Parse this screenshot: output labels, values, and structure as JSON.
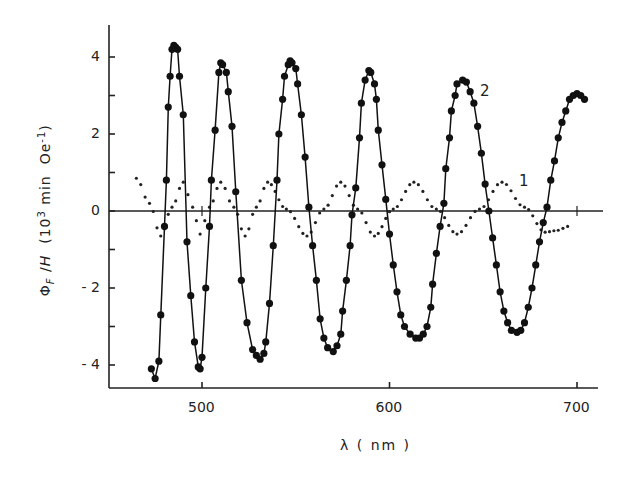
{
  "chart_data": {
    "type": "line",
    "title": "",
    "xlabel": "λ (nm)",
    "ylabel": "Φ_F / H (10^3 min Oe^-1)",
    "xlim": [
      450,
      713
    ],
    "ylim": [
      -4.6,
      4.8
    ],
    "x_ticks": [
      500,
      600,
      700
    ],
    "y_ticks": [
      -4,
      -2,
      0,
      2,
      4
    ],
    "grid": false,
    "legend": "inline labels '1' and '2' near curves",
    "series": [
      {
        "name": "1",
        "style": "dotted",
        "points": [
          [
            465,
            0.85
          ],
          [
            472,
            0.2
          ],
          [
            478,
            -0.65
          ],
          [
            484,
            0.1
          ],
          [
            490,
            0.75
          ],
          [
            495,
            0.1
          ],
          [
            499,
            -0.6
          ],
          [
            504,
            0.1
          ],
          [
            510,
            0.75
          ],
          [
            517,
            0.1
          ],
          [
            523,
            -0.65
          ],
          [
            529,
            0.1
          ],
          [
            535,
            0.75
          ],
          [
            545,
            0.05
          ],
          [
            556,
            -0.65
          ],
          [
            565,
            0.05
          ],
          [
            574,
            0.75
          ],
          [
            583,
            0.05
          ],
          [
            592,
            -0.65
          ],
          [
            602,
            0.05
          ],
          [
            613,
            0.75
          ],
          [
            625,
            0.05
          ],
          [
            636,
            -0.6
          ],
          [
            648,
            0.05
          ],
          [
            660,
            0.75
          ],
          [
            672,
            0.1
          ],
          [
            683,
            -0.55
          ],
          [
            690,
            -0.5
          ],
          [
            695,
            -0.4
          ]
        ]
      },
      {
        "name": "2",
        "style": "solid-with-markers",
        "points": [
          [
            473,
            -4.1
          ],
          [
            475,
            -4.35
          ],
          [
            477,
            -3.9
          ],
          [
            478,
            -2.7
          ],
          [
            480,
            -0.4
          ],
          [
            481,
            0.8
          ],
          [
            482,
            2.7
          ],
          [
            483,
            3.5
          ],
          [
            484,
            4.2
          ],
          [
            485,
            4.3
          ],
          [
            486,
            4.25
          ],
          [
            487,
            4.2
          ],
          [
            488,
            3.5
          ],
          [
            490,
            2.5
          ],
          [
            492,
            -0.8
          ],
          [
            494,
            -2.2
          ],
          [
            496,
            -3.4
          ],
          [
            498,
            -4.05
          ],
          [
            499,
            -4.1
          ],
          [
            500,
            -3.8
          ],
          [
            502,
            -2.0
          ],
          [
            504,
            -0.4
          ],
          [
            505,
            0.8
          ],
          [
            507,
            2.1
          ],
          [
            509,
            3.6
          ],
          [
            510,
            3.85
          ],
          [
            511,
            3.8
          ],
          [
            513,
            3.6
          ],
          [
            514,
            3.1
          ],
          [
            516,
            2.2
          ],
          [
            518,
            0.5
          ],
          [
            521,
            -1.8
          ],
          [
            524,
            -2.9
          ],
          [
            527,
            -3.6
          ],
          [
            529,
            -3.75
          ],
          [
            531,
            -3.85
          ],
          [
            533,
            -3.7
          ],
          [
            534,
            -3.4
          ],
          [
            536,
            -2.4
          ],
          [
            538,
            -0.9
          ],
          [
            540,
            0.8
          ],
          [
            541,
            2.0
          ],
          [
            543,
            2.9
          ],
          [
            544,
            3.5
          ],
          [
            546,
            3.8
          ],
          [
            547,
            3.9
          ],
          [
            548,
            3.85
          ],
          [
            550,
            3.7
          ],
          [
            551,
            3.3
          ],
          [
            553,
            2.5
          ],
          [
            555,
            1.4
          ],
          [
            557,
            0.1
          ],
          [
            559,
            -0.9
          ],
          [
            561,
            -1.8
          ],
          [
            563,
            -2.8
          ],
          [
            565,
            -3.3
          ],
          [
            567,
            -3.55
          ],
          [
            570,
            -3.65
          ],
          [
            572,
            -3.5
          ],
          [
            574,
            -3.2
          ],
          [
            575,
            -2.6
          ],
          [
            577,
            -1.8
          ],
          [
            579,
            -0.9
          ],
          [
            580,
            -0.1
          ],
          [
            582,
            0.6
          ],
          [
            584,
            1.9
          ],
          [
            585,
            2.8
          ],
          [
            587,
            3.4
          ],
          [
            589,
            3.65
          ],
          [
            590,
            3.6
          ],
          [
            592,
            3.3
          ],
          [
            593,
            2.9
          ],
          [
            594,
            2.1
          ],
          [
            596,
            1.2
          ],
          [
            598,
            0.3
          ],
          [
            600,
            -0.6
          ],
          [
            602,
            -1.4
          ],
          [
            604,
            -2.1
          ],
          [
            606,
            -2.7
          ],
          [
            608,
            -3.0
          ],
          [
            611,
            -3.2
          ],
          [
            614,
            -3.3
          ],
          [
            616,
            -3.3
          ],
          [
            618,
            -3.2
          ],
          [
            620,
            -3.0
          ],
          [
            622,
            -2.5
          ],
          [
            623,
            -1.9
          ],
          [
            625,
            -1.1
          ],
          [
            627,
            -0.4
          ],
          [
            629,
            0.2
          ],
          [
            630,
            1.1
          ],
          [
            632,
            1.9
          ],
          [
            633,
            2.6
          ],
          [
            635,
            3.0
          ],
          [
            636,
            3.3
          ],
          [
            639,
            3.4
          ],
          [
            641,
            3.35
          ],
          [
            643,
            3.1
          ],
          [
            645,
            2.8
          ],
          [
            647,
            2.2
          ],
          [
            649,
            1.5
          ],
          [
            651,
            0.7
          ],
          [
            653,
            0.0
          ],
          [
            655,
            -0.7
          ],
          [
            657,
            -1.4
          ],
          [
            659,
            -2.1
          ],
          [
            661,
            -2.6
          ],
          [
            663,
            -2.9
          ],
          [
            665,
            -3.1
          ],
          [
            668,
            -3.15
          ],
          [
            670,
            -3.1
          ],
          [
            672,
            -2.9
          ],
          [
            674,
            -2.5
          ],
          [
            676,
            -2.0
          ],
          [
            678,
            -1.4
          ],
          [
            680,
            -0.8
          ],
          [
            682,
            -0.3
          ],
          [
            684,
            0.1
          ],
          [
            686,
            0.8
          ],
          [
            688,
            1.3
          ],
          [
            690,
            1.9
          ],
          [
            692,
            2.3
          ],
          [
            694,
            2.6
          ],
          [
            696,
            2.9
          ],
          [
            698,
            3.0
          ],
          [
            700,
            3.05
          ],
          [
            702,
            3.0
          ],
          [
            704,
            2.9
          ]
        ]
      }
    ],
    "annotations": [
      {
        "text": "1",
        "x": 665,
        "y": 0.8
      },
      {
        "text": "2",
        "x": 652,
        "y": 3.1
      }
    ]
  },
  "axes": {
    "y_tick_labels": [
      "4",
      "2",
      "0",
      "- 2",
      "- 4"
    ],
    "x_tick_labels": [
      "500",
      "600",
      "700"
    ],
    "ylabel_text": "Φ F /H  (10³ min  Oe⁻¹)",
    "xlabel_text": "λ  ( nm )"
  },
  "labels": {
    "series1": "1",
    "series2": "2"
  }
}
